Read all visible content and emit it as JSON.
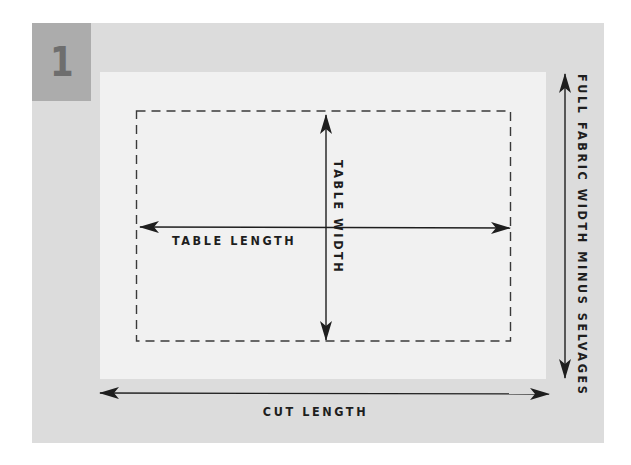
{
  "figure": {
    "step_number": "1",
    "labels": {
      "table_length": "TABLE LENGTH",
      "table_width": "TABLE WIDTH",
      "full_fabric_width": "FULL FABRIC WIDTH MINUS SELVAGES",
      "cut_length": "CUT LENGTH"
    },
    "colors": {
      "panel": "#dcdcdc",
      "badge": "#acacac",
      "badge_text": "#6e6e6e",
      "fabric": "#f1f1f1",
      "lines": "#1e1e1e"
    }
  }
}
